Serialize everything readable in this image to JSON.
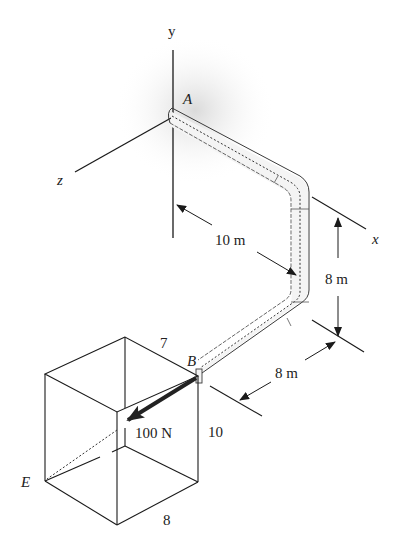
{
  "axes": {
    "x_label": "x",
    "y_label": "y",
    "z_label": "z"
  },
  "points": {
    "A": "A",
    "B": "B",
    "E": "E"
  },
  "dimensions": {
    "pipe_x_segment": "10 m",
    "pipe_y_segment": "8 m",
    "pipe_z_segment": "8 m"
  },
  "force": {
    "label": "100 N",
    "from": "B",
    "toward": "E"
  },
  "box": {
    "width_label": "7",
    "height_label": "10",
    "depth_label": "8"
  },
  "colors": {
    "line": "#1a1a1a",
    "pipe_fill": "#f2f2f2",
    "shadow": "#d9d9d9",
    "background": "#ffffff"
  }
}
